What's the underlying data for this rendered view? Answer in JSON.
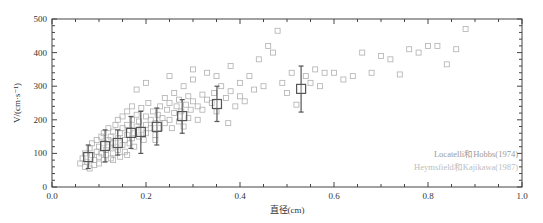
{
  "chart_data": {
    "type": "scatter",
    "title": "",
    "xlabel": "直径(cm)",
    "ylabel": "V/(cm·s⁻¹)",
    "xlim": [
      0.0,
      1.0
    ],
    "ylim": [
      0,
      500
    ],
    "x_ticks": [
      "0.0",
      "0.2",
      "0.4",
      "0.6",
      "0.8",
      "1.0"
    ],
    "y_ticks": [
      "0",
      "100",
      "200",
      "300",
      "400",
      "500"
    ],
    "grid": false,
    "legend_position": "bottom-right",
    "series": [
      {
        "name": "Locatelli和Hobbs(1974)",
        "marker": "large-open-square-with-error-bars",
        "color": "#555555",
        "points": [
          {
            "x": 0.077,
            "y": 89,
            "ylow": 55,
            "yhigh": 125
          },
          {
            "x": 0.113,
            "y": 122,
            "ylow": 75,
            "yhigh": 170
          },
          {
            "x": 0.14,
            "y": 131,
            "ylow": 95,
            "yhigh": 170
          },
          {
            "x": 0.168,
            "y": 161,
            "ylow": 115,
            "yhigh": 210
          },
          {
            "x": 0.189,
            "y": 164,
            "ylow": 100,
            "yhigh": 225
          },
          {
            "x": 0.223,
            "y": 179,
            "ylow": 125,
            "yhigh": 235
          },
          {
            "x": 0.277,
            "y": 211,
            "ylow": 160,
            "yhigh": 260
          },
          {
            "x": 0.351,
            "y": 247,
            "ylow": 195,
            "yhigh": 300
          },
          {
            "x": 0.53,
            "y": 292,
            "ylow": 223,
            "yhigh": 360
          }
        ]
      },
      {
        "name": "Heymsfield和Kajikawa(1987)",
        "marker": "small-open-square",
        "color": "#b0b0b0",
        "points": [
          [
            0.06,
            70
          ],
          [
            0.065,
            85
          ],
          [
            0.07,
            60
          ],
          [
            0.07,
            100
          ],
          [
            0.075,
            75
          ],
          [
            0.08,
            55
          ],
          [
            0.08,
            115
          ],
          [
            0.085,
            95
          ],
          [
            0.085,
            130
          ],
          [
            0.09,
            65
          ],
          [
            0.09,
            80
          ],
          [
            0.095,
            105
          ],
          [
            0.095,
            140
          ],
          [
            0.1,
            70
          ],
          [
            0.1,
            90
          ],
          [
            0.1,
            120
          ],
          [
            0.105,
            150
          ],
          [
            0.105,
            100
          ],
          [
            0.11,
            80
          ],
          [
            0.11,
            130
          ],
          [
            0.11,
            160
          ],
          [
            0.115,
            110
          ],
          [
            0.115,
            95
          ],
          [
            0.12,
            140
          ],
          [
            0.12,
            120
          ],
          [
            0.12,
            175
          ],
          [
            0.125,
            85
          ],
          [
            0.125,
            150
          ],
          [
            0.13,
            100
          ],
          [
            0.13,
            130
          ],
          [
            0.13,
            165
          ],
          [
            0.135,
            120
          ],
          [
            0.135,
            185
          ],
          [
            0.14,
            110
          ],
          [
            0.14,
            145
          ],
          [
            0.14,
            200
          ],
          [
            0.145,
            90
          ],
          [
            0.145,
            160
          ],
          [
            0.15,
            125
          ],
          [
            0.15,
            175
          ],
          [
            0.15,
            210
          ],
          [
            0.155,
            140
          ],
          [
            0.155,
            105
          ],
          [
            0.16,
            155
          ],
          [
            0.16,
            185
          ],
          [
            0.16,
            225
          ],
          [
            0.165,
            130
          ],
          [
            0.165,
            170
          ],
          [
            0.17,
            145
          ],
          [
            0.17,
            200
          ],
          [
            0.17,
            240
          ],
          [
            0.175,
            160
          ],
          [
            0.175,
            120
          ],
          [
            0.18,
            180
          ],
          [
            0.18,
            215
          ],
          [
            0.185,
            150
          ],
          [
            0.185,
            195
          ],
          [
            0.19,
            170
          ],
          [
            0.19,
            235
          ],
          [
            0.195,
            140
          ],
          [
            0.2,
            185
          ],
          [
            0.2,
            210
          ],
          [
            0.2,
            160
          ],
          [
            0.205,
            250
          ],
          [
            0.21,
            175
          ],
          [
            0.21,
            200
          ],
          [
            0.215,
            225
          ],
          [
            0.22,
            190
          ],
          [
            0.22,
            155
          ],
          [
            0.225,
            215
          ],
          [
            0.23,
            240
          ],
          [
            0.23,
            175
          ],
          [
            0.235,
            205
          ],
          [
            0.24,
            265
          ],
          [
            0.24,
            190
          ],
          [
            0.245,
            230
          ],
          [
            0.25,
            200
          ],
          [
            0.25,
            250
          ],
          [
            0.255,
            175
          ],
          [
            0.26,
            220
          ],
          [
            0.26,
            280
          ],
          [
            0.265,
            240
          ],
          [
            0.27,
            195
          ],
          [
            0.27,
            260
          ],
          [
            0.275,
            225
          ],
          [
            0.28,
            300
          ],
          [
            0.285,
            245
          ],
          [
            0.29,
            205
          ],
          [
            0.29,
            270
          ],
          [
            0.295,
            230
          ],
          [
            0.3,
            255
          ],
          [
            0.3,
            320
          ],
          [
            0.31,
            240
          ],
          [
            0.31,
            200
          ],
          [
            0.32,
            275
          ],
          [
            0.32,
            230
          ],
          [
            0.33,
            260
          ],
          [
            0.33,
            340
          ],
          [
            0.34,
            250
          ],
          [
            0.345,
            280
          ],
          [
            0.35,
            225
          ],
          [
            0.36,
            300
          ],
          [
            0.37,
            265
          ],
          [
            0.375,
            190
          ],
          [
            0.38,
            285
          ],
          [
            0.39,
            240
          ],
          [
            0.4,
            310
          ],
          [
            0.4,
            270
          ],
          [
            0.41,
            255
          ],
          [
            0.42,
            330
          ],
          [
            0.43,
            290
          ],
          [
            0.44,
            380
          ],
          [
            0.45,
            300
          ],
          [
            0.46,
            420
          ],
          [
            0.47,
            400
          ],
          [
            0.48,
            465
          ],
          [
            0.49,
            310
          ],
          [
            0.5,
            280
          ],
          [
            0.51,
            340
          ],
          [
            0.52,
            245
          ],
          [
            0.54,
            330
          ],
          [
            0.55,
            310
          ],
          [
            0.56,
            350
          ],
          [
            0.57,
            300
          ],
          [
            0.58,
            340
          ],
          [
            0.6,
            340
          ],
          [
            0.62,
            320
          ],
          [
            0.64,
            330
          ],
          [
            0.66,
            400
          ],
          [
            0.68,
            340
          ],
          [
            0.7,
            390
          ],
          [
            0.72,
            380
          ],
          [
            0.74,
            335
          ],
          [
            0.76,
            410
          ],
          [
            0.78,
            400
          ],
          [
            0.8,
            420
          ],
          [
            0.82,
            420
          ],
          [
            0.84,
            365
          ],
          [
            0.86,
            410
          ],
          [
            0.88,
            470
          ],
          [
            0.2,
            310
          ],
          [
            0.18,
            290
          ],
          [
            0.25,
            330
          ],
          [
            0.3,
            350
          ],
          [
            0.35,
            330
          ],
          [
            0.38,
            360
          ],
          [
            0.28,
            180
          ],
          [
            0.16,
            95
          ],
          [
            0.13,
            80
          ],
          [
            0.22,
            140
          ]
        ]
      }
    ]
  }
}
